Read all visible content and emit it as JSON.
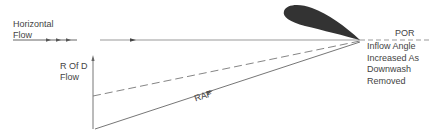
{
  "diagram": {
    "labels": {
      "horizontal_flow_line1": "Horizontal",
      "horizontal_flow_line2": "Flow",
      "rofd_line1": "R Of D",
      "rofd_line2": "Flow",
      "por": "POR",
      "raf": "RAF",
      "inflow_line1": "Inflow Angle",
      "inflow_line2": "Increased As",
      "inflow_line3": "Downwash",
      "inflow_line4": "Removed"
    },
    "colors": {
      "airfoil": "#333333",
      "line": "#8a8a8a",
      "text": "#444444"
    },
    "icons": {
      "flow_arrows": "arrowhead-triangle",
      "rofd_arrow": "arrow-up"
    }
  }
}
